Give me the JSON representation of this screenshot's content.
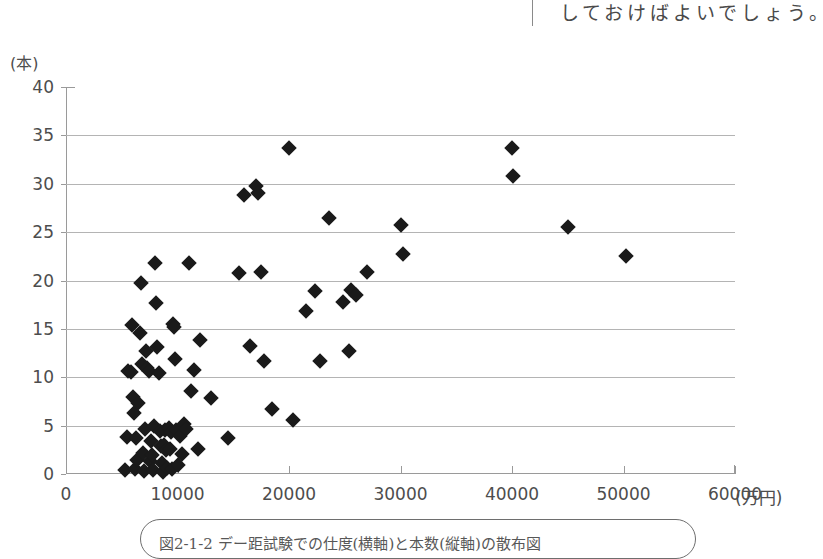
{
  "page": {
    "background_color": "#ffffff",
    "ink_color": "#4d4d4d",
    "marker_color": "#1a1a1a",
    "gridline_color": "#b4b4b4",
    "axis_color": "#9a9a9a"
  },
  "top_text": {
    "sentence": "しておけばよいでしょう。"
  },
  "caption": {
    "text": "図2-1-2 デー距試験での仕度(横軸)と本数(縦軸)の散布図"
  },
  "chart_data": {
    "type": "scatter",
    "title": "",
    "xlabel": "(万円)",
    "ylabel": "(本)",
    "xlim": [
      0,
      60000
    ],
    "ylim": [
      0,
      40
    ],
    "x_ticks": [
      0,
      10000,
      20000,
      30000,
      40000,
      50000,
      60000
    ],
    "x_tick_labels": [
      "0",
      "10000",
      "20000",
      "30000",
      "40000",
      "50000",
      "60000"
    ],
    "y_ticks": [
      0,
      5,
      10,
      15,
      20,
      25,
      30,
      35,
      40
    ],
    "y_tick_labels": [
      "0",
      "5",
      "10",
      "15",
      "20",
      "25",
      "30",
      "35",
      "40"
    ],
    "grid": "horizontal",
    "gridline_values": [
      5,
      10,
      15,
      20,
      25,
      30,
      35
    ],
    "legend": "none",
    "marker": "diamond",
    "points": [
      [
        5300,
        0.4
      ],
      [
        5500,
        3.8
      ],
      [
        5600,
        10.6
      ],
      [
        5800,
        10.5
      ],
      [
        5900,
        15.4
      ],
      [
        6000,
        8.0
      ],
      [
        6100,
        6.3
      ],
      [
        6200,
        0.5
      ],
      [
        6300,
        3.7
      ],
      [
        6400,
        1.4
      ],
      [
        6500,
        7.3
      ],
      [
        6600,
        14.6
      ],
      [
        6700,
        19.7
      ],
      [
        6800,
        11.4
      ],
      [
        6900,
        2.2
      ],
      [
        7000,
        0.3
      ],
      [
        7100,
        4.6
      ],
      [
        7200,
        12.7
      ],
      [
        7300,
        11.0
      ],
      [
        7400,
        10.6
      ],
      [
        7500,
        1.3
      ],
      [
        7600,
        3.4
      ],
      [
        7700,
        2.0
      ],
      [
        7800,
        0.4
      ],
      [
        7900,
        5.0
      ],
      [
        8000,
        21.8
      ],
      [
        8100,
        17.7
      ],
      [
        8200,
        13.1
      ],
      [
        8300,
        10.4
      ],
      [
        8400,
        4.4
      ],
      [
        8500,
        2.9
      ],
      [
        8600,
        1.1
      ],
      [
        8700,
        0.2
      ],
      [
        8800,
        3.0
      ],
      [
        8900,
        4.5
      ],
      [
        9000,
        2.5
      ],
      [
        9100,
        0.6
      ],
      [
        9200,
        4.8
      ],
      [
        9300,
        2.6
      ],
      [
        9400,
        4.3
      ],
      [
        9500,
        0.5
      ],
      [
        9600,
        15.5
      ],
      [
        9700,
        15.2
      ],
      [
        9800,
        11.9
      ],
      [
        9900,
        4.5
      ],
      [
        10000,
        0.9
      ],
      [
        10200,
        3.9
      ],
      [
        10400,
        2.1
      ],
      [
        10600,
        5.2
      ],
      [
        10800,
        4.6
      ],
      [
        11000,
        21.8
      ],
      [
        11200,
        8.6
      ],
      [
        11500,
        10.7
      ],
      [
        11800,
        2.6
      ],
      [
        12000,
        13.8
      ],
      [
        13000,
        7.9
      ],
      [
        14500,
        3.7
      ],
      [
        15500,
        20.8
      ],
      [
        16000,
        28.8
      ],
      [
        16500,
        13.2
      ],
      [
        17000,
        29.8
      ],
      [
        17200,
        29.0
      ],
      [
        17500,
        20.9
      ],
      [
        17800,
        11.7
      ],
      [
        18500,
        6.7
      ],
      [
        20000,
        33.7
      ],
      [
        20400,
        5.6
      ],
      [
        21500,
        16.8
      ],
      [
        22300,
        18.9
      ],
      [
        22800,
        11.7
      ],
      [
        23600,
        26.5
      ],
      [
        24800,
        17.8
      ],
      [
        25400,
        12.7
      ],
      [
        25600,
        19.0
      ],
      [
        26000,
        18.5
      ],
      [
        27000,
        20.9
      ],
      [
        30000,
        25.7
      ],
      [
        30200,
        22.7
      ],
      [
        40000,
        33.7
      ],
      [
        40100,
        30.8
      ],
      [
        45000,
        25.5
      ],
      [
        50200,
        22.5
      ]
    ]
  }
}
